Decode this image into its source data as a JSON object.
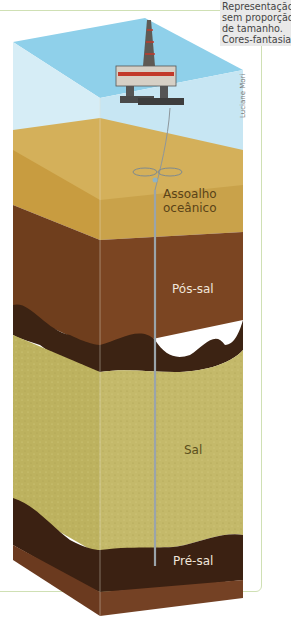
{
  "note": {
    "lines": [
      "Representação",
      "sem proporção",
      "de tamanho.",
      "Cores-fantasia."
    ]
  },
  "credit": "Luciane Mori",
  "layers": [
    {
      "id": "sea",
      "label": "",
      "color": "#a9d9ec"
    },
    {
      "id": "assoalho",
      "label_lines": [
        "Assoalho",
        "oceânico"
      ],
      "color": "#c9a24a"
    },
    {
      "id": "pos-sal",
      "label": "Pós-sal",
      "color": "#7a4520"
    },
    {
      "id": "sal",
      "label": "Sal",
      "color": "#c3b866"
    },
    {
      "id": "pre-sal",
      "label": "Pré-sal",
      "color": "#3b2112"
    }
  ],
  "colors": {
    "water": "#8fd0ea",
    "water_side": "#d4ecf5",
    "sand_top": "#d2ad58",
    "post_salt": "#7b4522",
    "dark_band": "#3c2313",
    "salt": "#c4b96a",
    "pre_salt_base": "#6b3a1f",
    "pipe": "#9aa4aa"
  }
}
